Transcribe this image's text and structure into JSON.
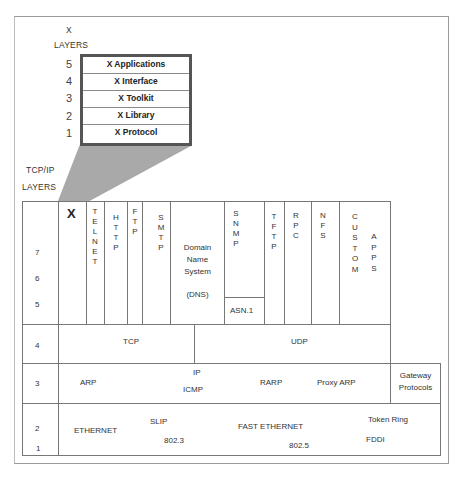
{
  "x_stack": {
    "caption_line1": "X",
    "caption_line2": "LAYERS",
    "layers": [
      {
        "number": "5",
        "label": "X Applications"
      },
      {
        "number": "4",
        "label": "X Interface"
      },
      {
        "number": "3",
        "label": "X Toolkit"
      },
      {
        "number": "2",
        "label": "X Library"
      },
      {
        "number": "1",
        "label": "X Protocol"
      }
    ],
    "frame_color": "#555555",
    "funnel_color": "#a9a9a9"
  },
  "tcpip": {
    "caption_line1": "TCP/IP",
    "caption_line2": "LAYERS",
    "application_layer_numbers": [
      "7",
      "6",
      "5"
    ],
    "application_protocols": {
      "x": "X",
      "telnet": "T\nE\nL\nN\nE\nT",
      "http": "H\nT\nT\nP",
      "ftp": "F\nT\nP",
      "smtp": "S\nM\nT\nP",
      "dns_line1": "Domain",
      "dns_line2": "Name",
      "dns_line3": "System",
      "dns_line4": "(DNS)",
      "snmp": "S\nN\nM\nP",
      "asn1": "ASN.1",
      "tftp": "T\nF\nT\nP",
      "rpc": "R\nP\nC",
      "nfs": "N\nF\nS",
      "custom": "C\nU\nS\nT\nO\nM",
      "apps": "A\nP\nP\nS"
    },
    "transport_layer": {
      "number": "4",
      "tcp": "TCP",
      "udp": "UDP"
    },
    "network_layer": {
      "number": "3",
      "arp": "ARP",
      "ip": "IP",
      "icmp": "ICMP",
      "rarp": "RARP",
      "proxy_arp": "Proxy ARP",
      "gateway_line1": "Gateway",
      "gateway_line2": "Protocols"
    },
    "link_layer": {
      "number_2": "2",
      "number_1": "1",
      "ethernet": "ETHERNET",
      "slip": "SLIP",
      "ieee_8023": "802.3",
      "fast_ethernet": "FAST ETHERNET",
      "ieee_8025": "802.5",
      "token_ring": "Token Ring",
      "fddi": "FDDI"
    }
  }
}
